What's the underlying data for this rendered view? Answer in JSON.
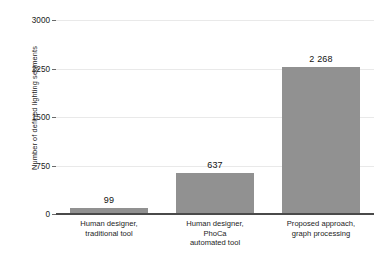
{
  "chart_data": {
    "type": "bar",
    "title": "",
    "xlabel": "",
    "ylabel": "Number of defined lighting segments",
    "categories": [
      "Human designer,\ntraditional tool",
      "Human designer,\nPhoCa\nautomated tool",
      "Proposed approach,\ngraph processing"
    ],
    "values": [
      99,
      637,
      2268
    ],
    "value_labels": [
      "99",
      "637",
      "2 268"
    ],
    "ylim": [
      0,
      3000
    ],
    "yticks": [
      0,
      750,
      1500,
      2250,
      3000
    ],
    "ytick_labels": [
      "0",
      "750",
      "1500",
      "2250",
      "3000"
    ],
    "grid": true,
    "legend": "none",
    "bar_color": "#919191",
    "axis_color": "#4a4a4a",
    "grid_color": "#e9e9e9",
    "background": "#ffffff"
  }
}
